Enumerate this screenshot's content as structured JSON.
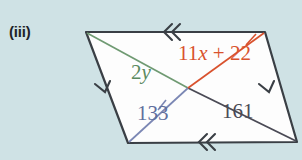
{
  "figure": {
    "part_label": "(iii)",
    "shape": "parallelogram",
    "background_color": "#cfe2e5",
    "interior_color": "#fdfdfd",
    "outline_color": "#3a3f45",
    "vertices": {
      "top_left": [
        86,
        32
      ],
      "top_right": [
        265,
        32
      ],
      "bottom_right": [
        297,
        142
      ],
      "bottom_left": [
        128,
        143
      ]
    },
    "diagonal_intersection": [
      188,
      88
    ],
    "tick_marks": {
      "top_edge": "double-chevron",
      "bottom_edge": "double-chevron",
      "left_edge": "single-chevron",
      "right_edge": "single-chevron"
    },
    "labels": [
      {
        "id": "angle-2y",
        "text": "2y",
        "prefix": "2",
        "variable": "y",
        "color": "#5a8a5f",
        "x": 131,
        "y": 79,
        "segment": "green-diagonal-upper-left"
      },
      {
        "id": "angle-11x-22",
        "text": "11x + 22",
        "prefix": "11",
        "variable": "x",
        "suffix": " + 22",
        "color": "#d9522e",
        "x": 178,
        "y": 60,
        "segment": "red-diagonal-upper-right"
      },
      {
        "id": "angle-133",
        "text": "133",
        "color": "#5f6f9e",
        "x": 137,
        "y": 120,
        "segment": "blue-diagonal-lower-left"
      },
      {
        "id": "angle-161",
        "text": "161",
        "color": "#4a4a55",
        "x": 222,
        "y": 118,
        "segment": "gray-diagonal-lower-right"
      }
    ]
  }
}
